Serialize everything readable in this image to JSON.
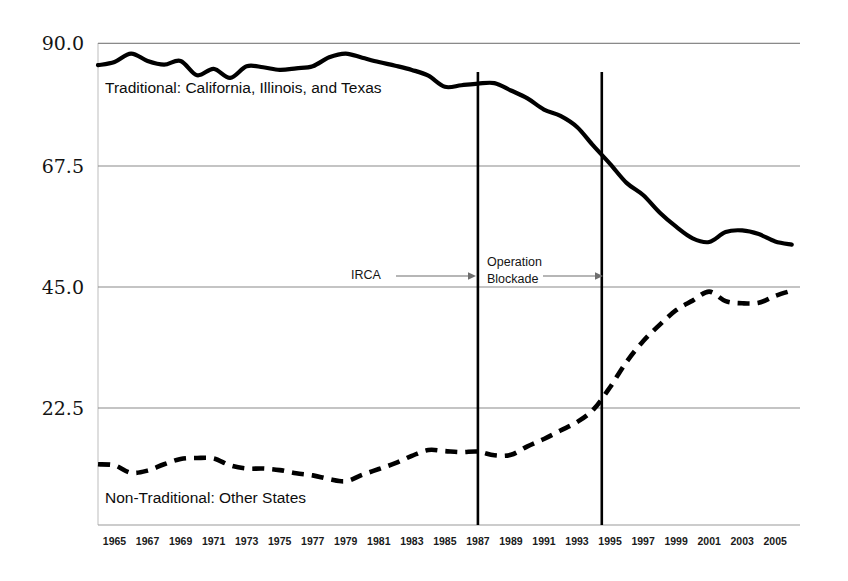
{
  "chart_data": {
    "type": "line",
    "title": "",
    "subtitle": "",
    "xlabel": "",
    "ylabel": "",
    "xlim": [
      1964,
      2006.5
    ],
    "ylim": [
      0.7,
      92.0
    ],
    "grid": true,
    "grid_axis": "y",
    "legend_position": "inline-annotations",
    "y_ticks": [
      "90.0",
      "67.5",
      "45.0",
      "22.5"
    ],
    "y_tick_values": [
      90.0,
      67.5,
      45.0,
      22.5
    ],
    "x_ticks": [
      "1965",
      "1967",
      "1969",
      "1971",
      "1973",
      "1975",
      "1977",
      "1979",
      "1981",
      "1983",
      "1985",
      "1987",
      "1989",
      "1991",
      "1993",
      "1995",
      "1997",
      "1999",
      "2001",
      "2003",
      "2005"
    ],
    "x": [
      1964,
      1965,
      1966,
      1967,
      1968,
      1969,
      1970,
      1971,
      1972,
      1973,
      1974,
      1975,
      1976,
      1977,
      1978,
      1979,
      1980,
      1981,
      1982,
      1983,
      1984,
      1985,
      1986,
      1987,
      1988,
      1989,
      1990,
      1991,
      1992,
      1993,
      1994,
      1995,
      1996,
      1997,
      1998,
      1999,
      2000,
      2001,
      2002,
      2003,
      2004,
      2005,
      2006
    ],
    "series": [
      {
        "name": "Traditional: California, Illinois, and Texas",
        "style": "solid",
        "values": [
          87.8,
          88.4,
          90.0,
          88.6,
          87.9,
          88.6,
          85.9,
          87.1,
          85.4,
          87.6,
          87.4,
          86.9,
          87.2,
          87.6,
          89.3,
          90.0,
          89.2,
          88.4,
          87.7,
          86.9,
          85.8,
          83.7,
          84.0,
          84.3,
          84.4,
          83.0,
          81.5,
          79.4,
          78.2,
          76.1,
          72.5,
          69.1,
          65.5,
          63.2,
          59.9,
          57.2,
          55.0,
          54.3,
          56.2,
          56.5,
          55.8,
          54.4,
          53.8
        ]
      },
      {
        "name": "Non-Traditional: Other States",
        "style": "dashed",
        "values": [
          12.2,
          12.0,
          10.6,
          11.0,
          12.2,
          13.2,
          13.4,
          13.3,
          12.0,
          11.4,
          11.4,
          11.1,
          10.5,
          10.1,
          9.4,
          9.0,
          10.2,
          11.3,
          12.4,
          13.8,
          14.9,
          14.7,
          14.5,
          14.6,
          13.9,
          14.0,
          15.6,
          17.0,
          18.6,
          20.2,
          22.6,
          26.8,
          31.6,
          35.5,
          38.6,
          41.4,
          43.2,
          44.9,
          43.1,
          42.7,
          42.8,
          44.1,
          45.1
        ]
      }
    ],
    "annotations": [
      {
        "name": "irca",
        "label": "IRCA",
        "label_lines": [
          "IRCA"
        ],
        "event_year": 1987,
        "arrow": true
      },
      {
        "name": "operation-blockade",
        "label": "Operation Blockade",
        "label_lines": [
          "Operation",
          "Blockade"
        ],
        "event_year": 1994.5,
        "arrow": true
      }
    ],
    "event_lines": [
      {
        "name": "irca-line",
        "year": 1987
      },
      {
        "name": "operation-blockade-line",
        "year": 1994.5
      }
    ],
    "colors": {
      "series_line": "#000000",
      "gridline": "#8a8a8a",
      "event_line": "#000000",
      "background": "#ffffff",
      "text": "#141414"
    }
  }
}
